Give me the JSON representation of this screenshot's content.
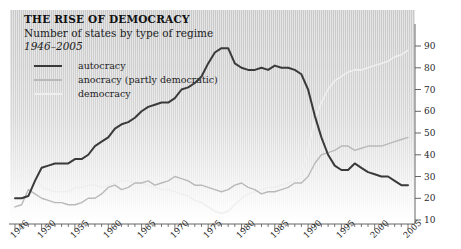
{
  "header": {
    "title": "THE RISE OF DEMOCRACY",
    "subtitle": "Number of states by type of regime",
    "daterange": "1946–2005"
  },
  "legend": [
    {
      "label": "autocracy",
      "color": "#3a3a3a"
    },
    {
      "label": "anocracy (partly democratic)",
      "color": "#b9b9b9"
    },
    {
      "label": "democracy",
      "color": "#efefef"
    }
  ],
  "axes": {
    "y_ticks": [
      "90",
      "80",
      "70",
      "60",
      "50",
      "40",
      "30",
      "20",
      "10"
    ],
    "x_ticks": [
      "1946",
      "1950",
      "1955",
      "1960",
      "1965",
      "1970",
      "1975",
      "1980",
      "1985",
      "1990",
      "1995",
      "2000",
      "2005"
    ]
  },
  "chart_data": {
    "type": "line",
    "title": "THE RISE OF DEMOCRACY",
    "subtitle": "Number of states by type of regime",
    "xlabel": "",
    "ylabel": "Number of states",
    "xlim": [
      1946,
      2005
    ],
    "ylim": [
      10,
      90
    ],
    "grid": false,
    "legend_position": "top-left",
    "x": [
      1946,
      1947,
      1948,
      1949,
      1950,
      1951,
      1952,
      1953,
      1954,
      1955,
      1956,
      1957,
      1958,
      1959,
      1960,
      1961,
      1962,
      1963,
      1964,
      1965,
      1966,
      1967,
      1968,
      1969,
      1970,
      1971,
      1972,
      1973,
      1974,
      1975,
      1976,
      1977,
      1978,
      1979,
      1980,
      1981,
      1982,
      1983,
      1984,
      1985,
      1986,
      1987,
      1988,
      1989,
      1990,
      1991,
      1992,
      1993,
      1994,
      1995,
      1996,
      1997,
      1998,
      1999,
      2000,
      2001,
      2002,
      2003,
      2004,
      2005
    ],
    "series": [
      {
        "name": "autocracy",
        "color": "#3a3a3a",
        "values": [
          20,
          20,
          21,
          28,
          34,
          35,
          36,
          36,
          36,
          38,
          38,
          40,
          44,
          46,
          48,
          52,
          54,
          55,
          57,
          60,
          62,
          63,
          64,
          64,
          66,
          70,
          71,
          73,
          76,
          82,
          87,
          89,
          89,
          82,
          80,
          79,
          79,
          80,
          79,
          81,
          80,
          80,
          79,
          77,
          70,
          58,
          48,
          40,
          35,
          33,
          33,
          36,
          34,
          32,
          31,
          30,
          30,
          28,
          26,
          26
        ]
      },
      {
        "name": "anocracy (partly democratic)",
        "color": "#b9b9b9",
        "values": [
          16,
          17,
          24,
          22,
          20,
          19,
          18,
          18,
          17,
          17,
          18,
          20,
          20,
          22,
          25,
          26,
          24,
          25,
          27,
          27,
          28,
          26,
          27,
          28,
          30,
          29,
          28,
          26,
          26,
          25,
          24,
          23,
          24,
          26,
          27,
          25,
          24,
          22,
          23,
          23,
          24,
          25,
          27,
          27,
          30,
          36,
          40,
          41,
          42,
          44,
          44,
          42,
          43,
          44,
          44,
          44,
          45,
          46,
          47,
          48
        ]
      },
      {
        "name": "democracy",
        "color": "#efefef",
        "values": [
          30,
          31,
          33,
          30,
          25,
          24,
          23,
          23,
          23,
          25,
          25,
          26,
          26,
          25,
          26,
          27,
          28,
          28,
          27,
          27,
          26,
          25,
          24,
          24,
          23,
          22,
          21,
          19,
          18,
          16,
          14,
          13,
          14,
          17,
          20,
          22,
          23,
          24,
          25,
          25,
          26,
          27,
          28,
          30,
          42,
          56,
          64,
          70,
          74,
          76,
          78,
          79,
          79,
          80,
          81,
          82,
          83,
          85,
          86,
          88
        ]
      }
    ]
  }
}
